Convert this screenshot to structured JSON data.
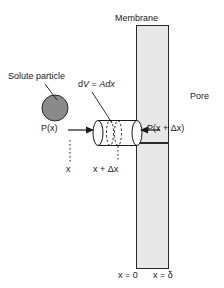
{
  "figure": {
    "background_color": "#ffffff",
    "stroke_color": "#1a1a1a",
    "membrane_fill": "#e8e8e8",
    "particle_fill": "#8a8a8a"
  },
  "labels": {
    "membrane": "Membrane",
    "solute_particle": "Solute particle",
    "pore": "Pore",
    "control_volume": "dV = Adx",
    "control_volume_parts": {
      "d": "d",
      "V": "V",
      "eq": " = ",
      "A": "A",
      "dx": "dx"
    },
    "pressure_left": "P(x)",
    "pressure_right": "P(x + Δx)",
    "position_x": "x",
    "position_x_plus_dx": "x + Δx",
    "boundary_left": "x = 0",
    "boundary_right": "x = δ"
  },
  "geometry": {
    "membrane_top_rect": {
      "x": 136,
      "y": 25,
      "width": 33,
      "height": 118
    },
    "membrane_bottom_rect": {
      "x": 136,
      "y": 143,
      "width": 33,
      "height": 126
    },
    "particle": {
      "cx": 55,
      "cy": 108,
      "r": 13
    },
    "cylinder": {
      "x_left": 96,
      "x_right": 137,
      "y_top": 120,
      "y_bottom": 146,
      "cap_rx": 5
    },
    "dv_slab": {
      "x": 110,
      "width": 8
    }
  }
}
